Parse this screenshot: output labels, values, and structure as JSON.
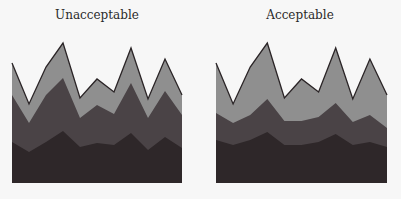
{
  "chart_data": [
    {
      "type": "area",
      "stacked": true,
      "title": "Unacceptable",
      "xlabel": "",
      "ylabel": "",
      "grid": false,
      "legend": null,
      "x": [
        0,
        1,
        2,
        3,
        4,
        5,
        6,
        7,
        8,
        9,
        10
      ],
      "series": [
        {
          "name": "bottom",
          "color": "#2e2729",
          "values": [
            41,
            31,
            41,
            52,
            36,
            40,
            38,
            50,
            33,
            46,
            35
          ]
        },
        {
          "name": "middle",
          "color": "#4a4346",
          "values": [
            47,
            29,
            47,
            53,
            29,
            38,
            31,
            50,
            32,
            46,
            33
          ]
        },
        {
          "name": "top",
          "color": "#8f8f8f",
          "values": [
            32,
            19,
            28,
            35,
            20,
            26,
            22,
            35,
            19,
            32,
            20
          ]
        }
      ],
      "plot_px": {
        "x0": 12,
        "x1": 182,
        "base": 183
      }
    },
    {
      "type": "area",
      "stacked": true,
      "title": "Acceptable",
      "xlabel": "",
      "ylabel": "",
      "grid": false,
      "legend": null,
      "x": [
        0,
        1,
        2,
        3,
        4,
        5,
        6,
        7,
        8,
        9,
        10
      ],
      "series": [
        {
          "name": "bottom",
          "color": "#2e2729",
          "values": [
            43,
            38,
            43,
            51,
            38,
            38,
            41,
            49,
            38,
            41,
            36
          ]
        },
        {
          "name": "middle",
          "color": "#4a4346",
          "values": [
            27,
            22,
            25,
            33,
            24,
            24,
            25,
            31,
            23,
            27,
            19
          ]
        },
        {
          "name": "top",
          "color": "#8f8f8f",
          "values": [
            50,
            19,
            48,
            56,
            23,
            42,
            25,
            55,
            23,
            56,
            33
          ]
        }
      ],
      "plot_px": {
        "x0": 216,
        "x1": 387,
        "base": 183
      }
    }
  ],
  "charts": [
    {
      "title": "Unacceptable"
    },
    {
      "title": "Acceptable"
    }
  ]
}
